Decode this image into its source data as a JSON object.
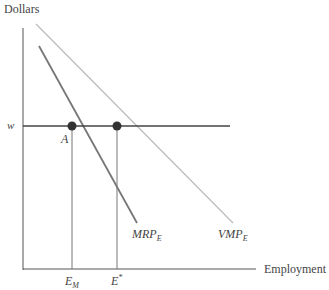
{
  "diagram": {
    "y_axis_label": "Dollars",
    "x_axis_label": "Employment",
    "wage_label": "w",
    "point_label": "A",
    "curves": [
      {
        "name": "MRP",
        "subscript": "E"
      },
      {
        "name": "VMP",
        "subscript": "E"
      }
    ],
    "x_ticks": [
      {
        "main": "E",
        "sub": "M"
      },
      {
        "main": "E",
        "sup": "*"
      }
    ],
    "colors": {
      "axis": "#555555",
      "wage_line": "#444444",
      "mrp_line": "#777777",
      "vmp_line": "#bbbbbb",
      "points": "#333333"
    }
  }
}
